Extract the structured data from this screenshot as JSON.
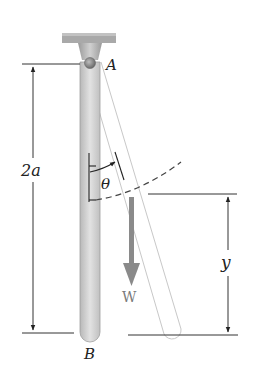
{
  "diagram": {
    "type": "mechanics-free-body",
    "labels": {
      "pivot": "A",
      "bottom_end": "B",
      "length": "2a",
      "angle": "θ",
      "weight": "W",
      "height": "y"
    },
    "colors": {
      "support": "#a9a9a9",
      "rod_fill": "#d6d6d6",
      "rod_stroke": "#9a9a9a",
      "displaced_rod_stroke": "#c4c4c4",
      "weight_arrow": "#8a8a8a",
      "dimension_line": "#333333",
      "dashed_arc": "#444444"
    }
  }
}
